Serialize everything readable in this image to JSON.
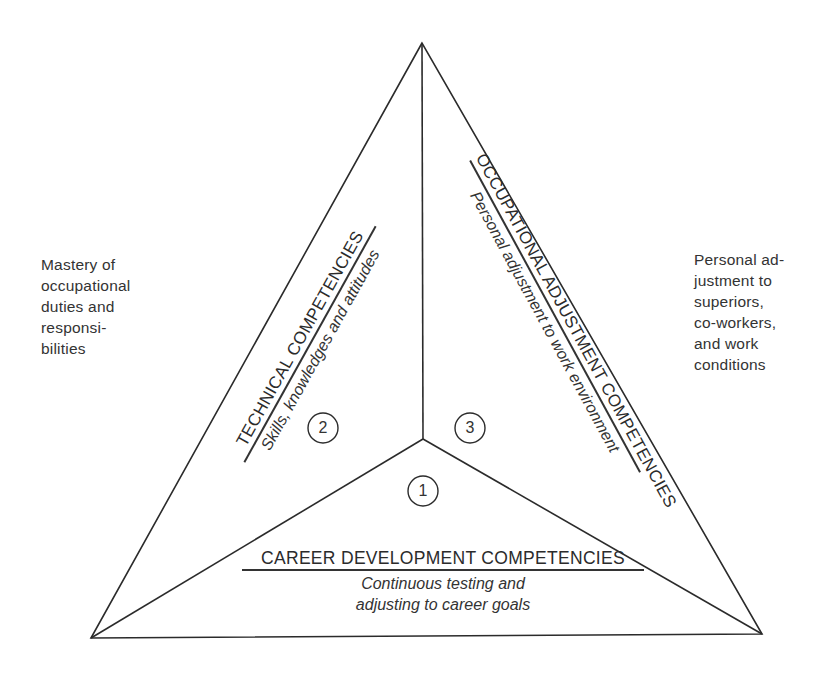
{
  "diagram": {
    "type": "competency-triangle",
    "side_notes": {
      "left": "Mastery of\noccupational\nduties and\nresponsi-\nbilities",
      "right": "Personal ad-\njustment to\nsuperiors,\nco-workers,\nand work\nconditions"
    },
    "sections": [
      {
        "number": "1",
        "title": "CAREER DEVELOPMENT COMPETENCIES",
        "subtitle_line1": "Continuous testing and",
        "subtitle_line2": "adjusting to career goals"
      },
      {
        "number": "2",
        "title": "TECHNICAL COMPETENCIES",
        "subtitle": "Skills, knowledges and attitudes"
      },
      {
        "number": "3",
        "title": "OCCUPATIONAL ADJUSTMENT COMPETENCIES",
        "subtitle": "Personal adjustment to work environment"
      }
    ],
    "colors": {
      "line": "#2b2b2b",
      "background": "#ffffff"
    }
  }
}
